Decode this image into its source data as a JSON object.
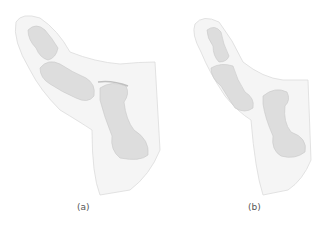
{
  "figure": {
    "panels": [
      {
        "id": "a",
        "label": "(a)",
        "subject": "thumb-bones-illustration"
      },
      {
        "id": "b",
        "label": "(b)",
        "subject": "thumb-bones-illustration-dislocated"
      }
    ],
    "colors": {
      "background": "#ffffff",
      "skin": "#f4f4f4",
      "skin_edge": "#d6d6d6",
      "bone": "#dcdcdc",
      "bone_edge": "#c4c4c4"
    }
  }
}
